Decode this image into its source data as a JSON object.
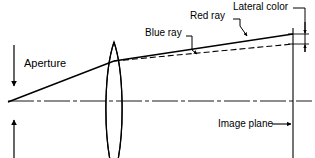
{
  "diagram": {
    "type": "optical-ray-diagram",
    "colors": {
      "stroke": "#000000",
      "background": "#ffffff"
    },
    "labels": {
      "aperture": "Aperture",
      "blue_ray": "Blue ray",
      "red_ray": "Red ray",
      "lateral_color": "Lateral color",
      "image_plane": "Image plane"
    },
    "elements": {
      "lens": {
        "name": "biconvex-lens",
        "center_x": 114,
        "top_y": 42,
        "bottom_y": 158,
        "half_thickness": 9
      },
      "optical_axis": {
        "name": "optical-axis",
        "y": 101,
        "x_start": 8,
        "x_end": 312,
        "style": "dash-dot"
      },
      "object_point": {
        "x": 8,
        "y": 102
      },
      "image_plane_line": {
        "x": 293,
        "y_top": 28,
        "y_bottom": 158
      },
      "red_ray": {
        "style": "solid",
        "start": {
          "x": 8,
          "y": 102
        },
        "bend": {
          "x": 114,
          "y": 61
        },
        "end": {
          "x": 293,
          "y": 34
        }
      },
      "blue_ray": {
        "style": "dashed",
        "start": {
          "x": 114,
          "y": 61
        },
        "end": {
          "x": 293,
          "y": 44
        }
      },
      "aperture_arrow_down": {
        "x": 14,
        "y_from": 45,
        "y_to": 88
      },
      "aperture_arrow_up": {
        "x": 14,
        "y_from": 158,
        "y_to": 118
      },
      "lateral_color_gauge": {
        "x": 305,
        "y_top": 20,
        "y_red": 34,
        "y_blue": 44
      }
    }
  }
}
